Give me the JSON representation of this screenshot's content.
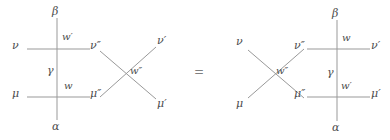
{
  "figure": {
    "type": "diagram",
    "relation": "=",
    "stroke_color": "#999999",
    "text_color": "#4d4d4d",
    "background": "#ffffff"
  },
  "left_diagram": {
    "name": "left-side",
    "labels": {
      "top_vertical": "β",
      "bottom_vertical": "α",
      "middle_vertical": "γ",
      "left_upper_leg": "ν",
      "left_lower_leg": "μ",
      "upper_vertex_weight": "w′",
      "lower_vertex_weight": "w",
      "cross_weight": "w″",
      "cross_in_upper": "ν″",
      "cross_in_lower": "μ″",
      "cross_out_upper": "ν′",
      "cross_out_lower": "μ′"
    }
  },
  "equals": {
    "symbol": "="
  },
  "right_diagram": {
    "name": "right-side",
    "labels": {
      "top_vertical": "β",
      "bottom_vertical": "α",
      "middle_vertical": "γ",
      "cross_in_upper": "ν",
      "cross_in_lower": "μ",
      "cross_weight": "w″",
      "cross_out_upper": "ν″",
      "cross_out_lower": "μ″",
      "upper_vertex_weight": "w",
      "lower_vertex_weight": "w′",
      "right_upper_leg": "ν′",
      "right_lower_leg": "μ′"
    }
  }
}
